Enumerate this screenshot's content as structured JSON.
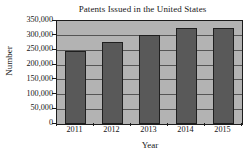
{
  "chart_data": {
    "type": "bar",
    "title": "Patents Issued in the United States",
    "xlabel": "Year",
    "ylabel": "Number",
    "categories": [
      "2011",
      "2012",
      "2013",
      "2014",
      "2015"
    ],
    "values": [
      248000,
      277000,
      303000,
      326000,
      326000
    ],
    "ylim": [
      0,
      350000
    ],
    "ytick_values": [
      0,
      50000,
      100000,
      150000,
      200000,
      250000,
      300000,
      350000
    ],
    "ytick_labels": [
      "0",
      "50,000",
      "100,000",
      "150,000",
      "200,000",
      "250,000",
      "300,000",
      "350,000"
    ],
    "grid": true,
    "legend": false,
    "colors": {
      "bar_fill": "#595959",
      "bar_edge": "#1f1f1f",
      "plot_background": "#b3b3b3",
      "gridline": "#555555",
      "axis": "#1c1c1c",
      "text": "#161616",
      "figure_background": "#ffffff"
    }
  }
}
